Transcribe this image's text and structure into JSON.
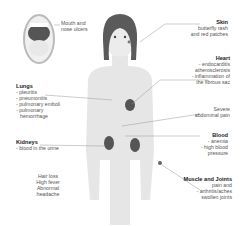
{
  "diagram": {
    "labels": {
      "mouth": {
        "text": "Mouth and nose ulcers",
        "lines": [
          "Mouth and",
          "nose ulcers"
        ]
      },
      "skin": {
        "title": "Skin",
        "lines": [
          "butterfly rash",
          "and red patches"
        ]
      },
      "heart": {
        "title": "Heart",
        "lines": [
          "- endocarditis",
          "atherosclerosis",
          "- inflammation of",
          "the fibrous sac"
        ]
      },
      "abdomen": {
        "lines": [
          "Severe",
          "abdominal pain"
        ]
      },
      "lungs": {
        "title": "Lungs",
        "lines": [
          "- pleuritis",
          "- pneumonitis",
          "- pulmonary emboli",
          "- pulmonary",
          "hemorrhage"
        ]
      },
      "blood": {
        "title": "Blood",
        "lines": [
          "- anemia",
          "- high blood",
          "pressure"
        ]
      },
      "kidneys": {
        "title": "Kidneys",
        "lines": [
          "- blood in the urine"
        ]
      },
      "general": {
        "lines": [
          "Hair loss",
          "High fever",
          "Abnormal",
          "headache"
        ]
      },
      "muscle": {
        "title": "Muscle and Joints",
        "lines": [
          "pain and",
          "- arthritis/aches",
          "swollen joints"
        ]
      }
    },
    "colors": {
      "body": "#e6e6e6",
      "hair": "#5a5a5a",
      "organ": "#6e6e6e",
      "line": "#999999"
    }
  }
}
